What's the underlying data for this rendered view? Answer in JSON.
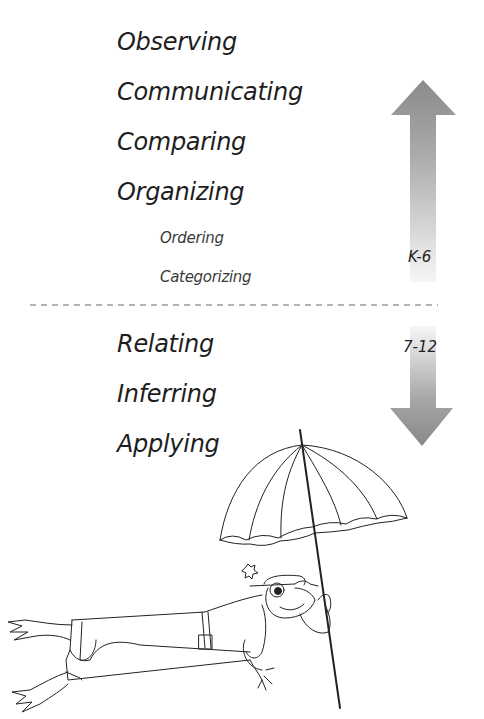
{
  "skills_upper": [
    {
      "label": "Observing",
      "level": "major"
    },
    {
      "label": "Communicating",
      "level": "major"
    },
    {
      "label": "Comparing",
      "level": "major"
    },
    {
      "label": "Organizing",
      "level": "major"
    },
    {
      "label": "Ordering",
      "level": "minor"
    },
    {
      "label": "Categorizing",
      "level": "minor"
    }
  ],
  "skills_lower": [
    {
      "label": "Relating",
      "level": "major"
    },
    {
      "label": "Inferring",
      "level": "major"
    },
    {
      "label": "Applying",
      "level": "major"
    }
  ],
  "arrows": {
    "up": {
      "direction": "up",
      "label": "K-6"
    },
    "down": {
      "direction": "down",
      "label": "7-12"
    }
  },
  "divider": {
    "style": "dashed"
  },
  "illustration": {
    "subject": "frog-with-umbrella"
  },
  "colors": {
    "arrow_dark": "#8a8a8a",
    "arrow_light": "#f4f4f4",
    "text": "#1e1e1e",
    "divider": "#9a9a9a"
  }
}
